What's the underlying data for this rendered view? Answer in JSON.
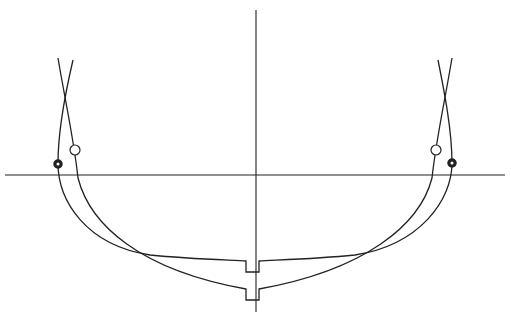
{
  "diagram": {
    "title": "",
    "colors": {
      "line": "#222222",
      "background": "#ffffff"
    },
    "elements": [
      {
        "name": "centerline",
        "type": "vertical-axis"
      },
      {
        "name": "waterline",
        "type": "horizontal-axis"
      },
      {
        "name": "section-shallow",
        "type": "curve",
        "feature": "flat bottom with keel notch"
      },
      {
        "name": "section-deep",
        "type": "curve",
        "feature": "rounded bottom with keel notch"
      },
      {
        "name": "marker-solid",
        "type": "filled circle",
        "count": 2
      },
      {
        "name": "marker-open",
        "type": "open circle",
        "count": 2
      }
    ]
  }
}
